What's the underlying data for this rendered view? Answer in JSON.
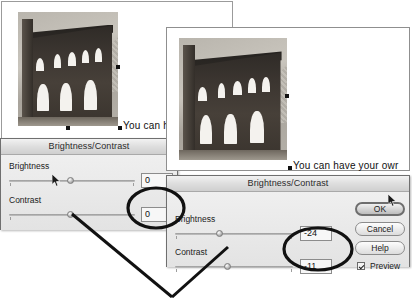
{
  "app": {
    "photo_alt": "grayscale-roman-amphitheater-ruin"
  },
  "windows": [
    {
      "name": "back-document-window"
    },
    {
      "name": "front-document-window"
    }
  ],
  "captions": [
    {
      "text": "You can ha"
    },
    {
      "text": "You can have your owr"
    }
  ],
  "dialog_back": {
    "title": "Brightness/Contrast",
    "brightness": {
      "label": "Brightness",
      "value": "0",
      "knob_percent": 50
    },
    "contrast": {
      "label": "Contrast",
      "value": "0",
      "knob_percent": 50
    }
  },
  "dialog_front": {
    "title": "Brightness/Contrast",
    "brightness": {
      "label": "Brightness",
      "value": "-24",
      "knob_percent": 38
    },
    "contrast": {
      "label": "Contrast",
      "value": "-11",
      "knob_percent": 44
    },
    "buttons": {
      "ok": "OK",
      "cancel": "Cancel",
      "help": "Help"
    },
    "preview": {
      "label": "Preview",
      "checked": true
    }
  },
  "annotations": {
    "highlight_ellipses": 2,
    "pointer_lines": 2,
    "ink_color": "#111111"
  },
  "colors": {
    "page_background": "#ffffff",
    "dialog_face": "#e8e8e8",
    "dialog_border": "#6f6f6f",
    "title_bar": "#dedede",
    "field_background": "#f7f7f7",
    "annotation_ink": "#111111"
  }
}
